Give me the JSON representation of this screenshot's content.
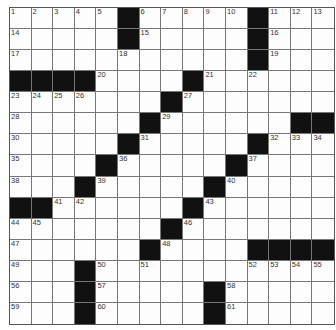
{
  "puzzle": {
    "rows": 15,
    "cols": 15,
    "layout": [
      "1 2 3 4 5 # 6 7 8 9 10 # 11 12 13",
      "14 . . . . # 15 . . . . # 16 . .",
      "17 . . . . 18 . . . . . # 19 . .",
      "# # # # 20 . . . # 21 . 22 . . .",
      "23 24 25 26 . . . # 27 . . . . . .",
      "28 . . . . . # 29 . . . . . # #",
      "30 . . . . # 31 . . . . # 32 33 34",
      "35 . . . # 36 . . . . # 37 . . .",
      "38 . . # 39 . . . . # 40 . . . .",
      "# # 41 42 . . . . # 43 . . . . .",
      "44 45 . . . . . # 46 . . . . . .",
      "47 . . . . . # 48 . . . # # # #",
      "49 . . # 50 . 51 . . . . 52 53 54 55",
      "56 . . # 57 . . . . # 58 . . . .",
      "59 . . # 60 . . . . # 61 . . . ."
    ],
    "colors": {
      "block": "#111111",
      "cell": "#fdfdfd",
      "line": "#777777"
    }
  }
}
